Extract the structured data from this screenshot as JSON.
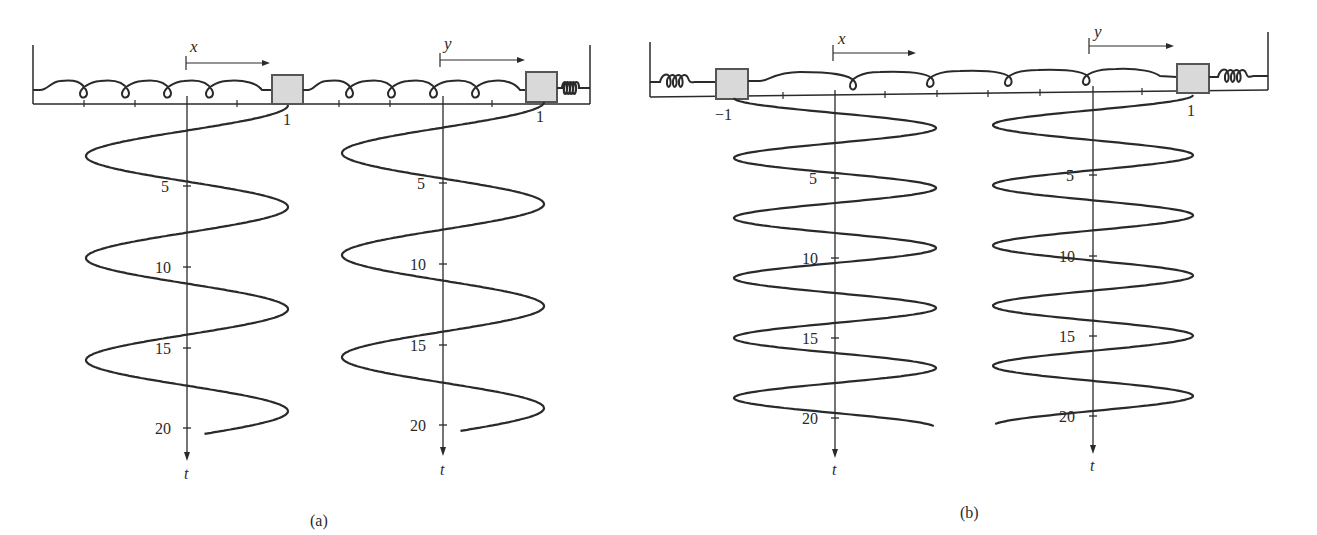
{
  "figure": {
    "panels": [
      {
        "id": "a",
        "caption": "(a)",
        "left_spring": "loose-coil spring",
        "right_spring": "tight-coil spring (stiff)",
        "coupling_spring": "loose-coil spring",
        "axis_x_label": "x",
        "axis_y_label": "y",
        "mass1_position_label": "1",
        "mass2_position_label": "1",
        "t_axis_label": "t",
        "t_ticks": [
          "5",
          "10",
          "15",
          "20"
        ],
        "curve_description": "x(t) and y(t) both start at 1 and oscillate in phase with amplitude 1",
        "period": 6.3,
        "t_end": 20.3
      },
      {
        "id": "b",
        "caption": "(b)",
        "left_spring": "coil spring",
        "right_spring": "coil spring",
        "coupling_spring": "loose-coil spring",
        "axis_x_label": "x",
        "axis_y_label": "y",
        "mass1_position_label": "−1",
        "mass2_position_label": "1",
        "t_axis_label": "t",
        "t_ticks": [
          "5",
          "10",
          "15",
          "20"
        ],
        "curve_description": "x(t) starts at -1, y(t) starts at 1; masses oscillate in opposite phase with amplitude 1 and higher frequency",
        "period": 3.75,
        "t_end": 20.5
      }
    ],
    "colors": {
      "ink": "#2a2a2a",
      "mass_fill": "#d9d9d9",
      "mass_stroke": "#555555"
    }
  }
}
